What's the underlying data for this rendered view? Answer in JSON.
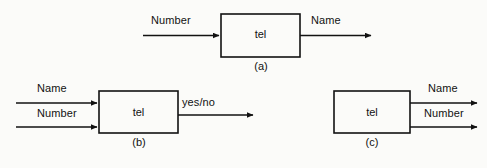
{
  "figure": {
    "background_color": "#fbfbf9",
    "line_color": "#121212",
    "text_color": "#121212"
  },
  "diagrams": [
    {
      "id": "a",
      "caption": "(a)",
      "box_label": "tel",
      "inputs": [
        {
          "label": "Number"
        }
      ],
      "outputs": [
        {
          "label": "Name"
        }
      ]
    },
    {
      "id": "b",
      "caption": "(b)",
      "box_label": "tel",
      "inputs": [
        {
          "label": "Name"
        },
        {
          "label": "Number"
        }
      ],
      "outputs": [
        {
          "label": "yes/no"
        }
      ]
    },
    {
      "id": "c",
      "caption": "(c)",
      "box_label": "tel",
      "inputs": [],
      "outputs": [
        {
          "label": "Name"
        },
        {
          "label": "Number"
        }
      ]
    }
  ]
}
